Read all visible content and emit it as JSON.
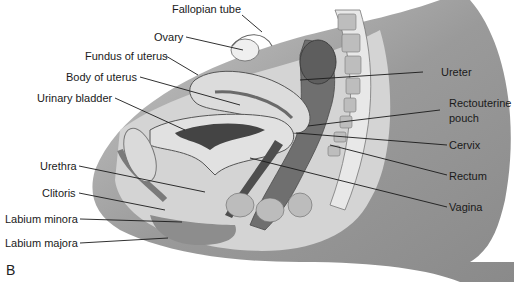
{
  "figure": {
    "panel_label": "B",
    "labels_left": [
      {
        "text": "Fallopian tube"
      },
      {
        "text": "Ovary"
      },
      {
        "text": "Fundus of uterus"
      },
      {
        "text": "Body of uterus"
      },
      {
        "text": "Urinary bladder"
      },
      {
        "text": "Urethra"
      },
      {
        "text": "Clitoris"
      },
      {
        "text": "Labium minora"
      },
      {
        "text": "Labium majora"
      }
    ],
    "labels_right": [
      {
        "text": "Ureter"
      },
      {
        "text": "Rectouterine"
      },
      {
        "text": "pouch"
      },
      {
        "text": "Cervix"
      },
      {
        "text": "Rectum"
      },
      {
        "text": "Vagina"
      }
    ]
  }
}
